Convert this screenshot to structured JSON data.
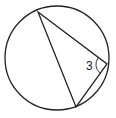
{
  "diagram": {
    "type": "circle-with-inscribed-triangle",
    "circle": {
      "cx": 57,
      "cy": 58,
      "r": 52
    },
    "vertices": {
      "top": {
        "x": 38,
        "y": 12
      },
      "right": {
        "x": 107,
        "y": 64
      },
      "bottom": {
        "x": 76,
        "y": 107
      }
    },
    "angle_label": "3",
    "stroke_color": "#222222"
  }
}
